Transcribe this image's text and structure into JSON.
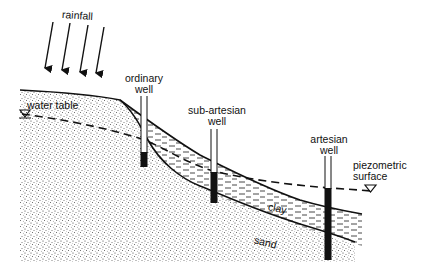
{
  "diagram": {
    "colors": {
      "ink": "#111111",
      "background": "#ffffff",
      "sand_fill": "#f4f4f4",
      "clay_fill": "#ffffff"
    },
    "labels": {
      "rainfall": "rainfall",
      "water_table": "water table",
      "ordinary_well_line1": "ordinary",
      "ordinary_well_line2": "well",
      "sub_artesian_well_line1": "sub-artesian",
      "sub_artesian_well_line2": "well",
      "artesian_well_line1": "artesian",
      "artesian_well_line2": "well",
      "piezometric_line1": "piezometric",
      "piezometric_line2": "surface",
      "clay": "clay",
      "sand": "sand"
    },
    "layers": [
      {
        "name": "sand",
        "pattern": "stipple"
      },
      {
        "name": "clay",
        "pattern": "dashes"
      }
    ],
    "wells": [
      {
        "name": "ordinary well"
      },
      {
        "name": "sub-artesian well"
      },
      {
        "name": "artesian well"
      }
    ],
    "symbols": {
      "water_table_marker": "inverted-triangle",
      "piezometric_marker": "inverted-triangle"
    },
    "rain_arrows": 4
  }
}
